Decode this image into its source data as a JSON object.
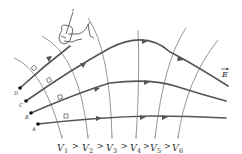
{
  "diagram": {
    "field_label": "E",
    "points": [
      {
        "id": "A",
        "label": "A"
      },
      {
        "id": "B",
        "label": "B"
      },
      {
        "id": "C",
        "label": "C"
      },
      {
        "id": "D",
        "label": "D"
      }
    ],
    "potentials": {
      "labels": [
        "V",
        "V",
        "V",
        "V",
        "V",
        "V"
      ],
      "subscripts": [
        "1",
        "2",
        "3",
        "4",
        "5",
        "6"
      ],
      "separator": ">",
      "ordering_text": "V1 > V2 > V3 > V4 > V5 > V6"
    },
    "colors": {
      "field_line": "#555555",
      "equipotential": "#8a8a8a",
      "background": "#ffffff"
    },
    "icons": [
      "hand-with-pen-icon",
      "right-angle-marker-icon",
      "arrow-icon"
    ]
  }
}
